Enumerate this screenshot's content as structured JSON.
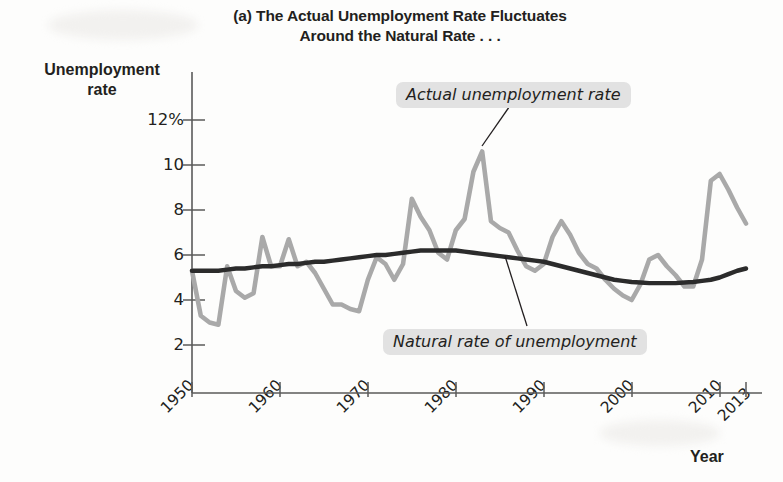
{
  "figure": {
    "title_line1": "(a) The Actual Unemployment Rate Fluctuates",
    "title_line2": "Around the Natural Rate . . .",
    "y_axis_title_line1": "Unemployment",
    "y_axis_title_line2": "rate",
    "x_axis_title": "Year",
    "callout_actual": "Actual unemployment rate",
    "callout_natural": "Natural rate of unemployment",
    "colors": {
      "actual_series": "#a9a9a9",
      "natural_series": "#2b2b2b",
      "axis": "#555555",
      "text": "#231f20",
      "callout_background": "#e2e2e2"
    }
  },
  "chart_data": {
    "type": "line",
    "title": "(a) The Actual Unemployment Rate Fluctuates Around the Natural Rate . . .",
    "xlabel": "Year",
    "ylabel": "Unemployment rate",
    "xlim": [
      1950,
      2013
    ],
    "ylim": [
      0,
      13
    ],
    "grid": false,
    "legend_position": "inline-annotations",
    "y_tick_labels": [
      "2",
      "4",
      "6",
      "8",
      "10",
      "12%"
    ],
    "y_ticks": [
      2,
      4,
      6,
      8,
      10,
      12
    ],
    "x_tick_labels": [
      "1950",
      "1960",
      "1970",
      "1980",
      "1990",
      "2000",
      "2010",
      "2013"
    ],
    "x_ticks": [
      1950,
      1960,
      1970,
      1980,
      1990,
      2000,
      2010,
      2013
    ],
    "annotations": [
      {
        "text": "Actual unemployment rate",
        "points_to_year": 1983,
        "points_to_value": 10.6
      },
      {
        "text": "Natural rate of unemployment",
        "points_to_year": 1985,
        "points_to_value": 6.1
      }
    ],
    "x": [
      1950,
      1951,
      1952,
      1953,
      1954,
      1955,
      1956,
      1957,
      1958,
      1959,
      1960,
      1961,
      1962,
      1963,
      1964,
      1965,
      1966,
      1967,
      1968,
      1969,
      1970,
      1971,
      1972,
      1973,
      1974,
      1975,
      1976,
      1977,
      1978,
      1979,
      1980,
      1981,
      1982,
      1983,
      1984,
      1985,
      1986,
      1987,
      1988,
      1989,
      1990,
      1991,
      1992,
      1993,
      1994,
      1995,
      1996,
      1997,
      1998,
      1999,
      2000,
      2001,
      2002,
      2003,
      2004,
      2005,
      2006,
      2007,
      2008,
      2009,
      2010,
      2011,
      2012,
      2013
    ],
    "series": [
      {
        "name": "Actual unemployment rate",
        "color": "#a9a9a9",
        "values": [
          5.3,
          3.3,
          3.0,
          2.9,
          5.5,
          4.4,
          4.1,
          4.3,
          6.8,
          5.5,
          5.5,
          6.7,
          5.5,
          5.7,
          5.2,
          4.5,
          3.8,
          3.8,
          3.6,
          3.5,
          4.9,
          5.9,
          5.6,
          4.9,
          5.6,
          8.5,
          7.7,
          7.1,
          6.1,
          5.8,
          7.1,
          7.6,
          9.7,
          10.6,
          7.5,
          7.2,
          7.0,
          6.2,
          5.5,
          5.3,
          5.6,
          6.8,
          7.5,
          6.9,
          6.1,
          5.6,
          5.4,
          4.9,
          4.5,
          4.2,
          4.0,
          4.7,
          5.8,
          6.0,
          5.5,
          5.1,
          4.6,
          4.6,
          5.8,
          9.3,
          9.6,
          8.9,
          8.1,
          7.4
        ]
      },
      {
        "name": "Natural rate of unemployment",
        "color": "#2b2b2b",
        "values": [
          5.3,
          5.3,
          5.3,
          5.3,
          5.35,
          5.4,
          5.4,
          5.45,
          5.5,
          5.5,
          5.55,
          5.6,
          5.6,
          5.65,
          5.7,
          5.7,
          5.75,
          5.8,
          5.85,
          5.9,
          5.95,
          6.0,
          6.0,
          6.05,
          6.1,
          6.15,
          6.2,
          6.2,
          6.2,
          6.2,
          6.2,
          6.15,
          6.1,
          6.05,
          6.0,
          5.95,
          5.9,
          5.85,
          5.8,
          5.75,
          5.7,
          5.6,
          5.5,
          5.4,
          5.3,
          5.2,
          5.1,
          5.0,
          4.9,
          4.85,
          4.8,
          4.78,
          4.75,
          4.75,
          4.75,
          4.75,
          4.78,
          4.8,
          4.85,
          4.9,
          5.0,
          5.15,
          5.3,
          5.4
        ]
      }
    ]
  }
}
